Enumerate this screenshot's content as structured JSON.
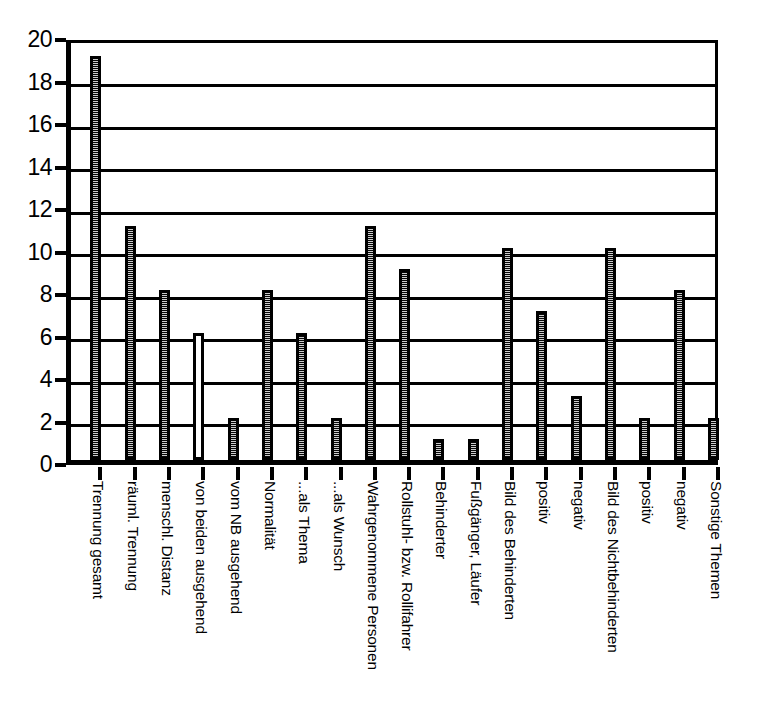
{
  "chart_data": {
    "type": "bar",
    "title": "",
    "subtitle": "",
    "xlabel": "",
    "ylabel": "",
    "ylim": [
      0,
      20
    ],
    "ytick_step": 2,
    "yticks": [
      20,
      18,
      16,
      14,
      12,
      10,
      8,
      6,
      4,
      2,
      0
    ],
    "grid": true,
    "gridlines_y": [
      20,
      18,
      16,
      14,
      12,
      10,
      8,
      6,
      4,
      2
    ],
    "legend": null,
    "legend_position": "none",
    "orientation": "vertical",
    "bar_style_default": "filled-hatched",
    "categories": [
      "Trennung gesamt",
      "räuml. Trennung",
      "menschl. Distanz",
      "von beiden ausgehend",
      "vom NB ausgehend",
      "Normalität",
      "...als Thema",
      "...als Wunsch",
      "Wahrgenommene Personen",
      "Rollstuhl- bzw. Rollifahrer",
      "Behinderter",
      "Fußgänger, Läufer",
      "Bild des Behinderten",
      "positiv",
      "negativ",
      "Bild des Nichtbehinderten",
      "positiv",
      "negativ",
      "Sonstige Themen"
    ],
    "values": [
      19,
      11,
      8,
      6,
      2,
      8,
      6,
      2,
      11,
      9,
      1,
      1,
      10,
      7,
      3,
      10,
      2,
      8,
      2
    ],
    "bar_styles": [
      "filled",
      "filled",
      "filled",
      "hollow",
      "filled",
      "filled",
      "filled",
      "filled",
      "filled",
      "filled",
      "filled",
      "filled",
      "filled",
      "filled",
      "filled",
      "filled",
      "filled",
      "filled",
      "filled"
    ],
    "colors": {
      "axis": "#000000",
      "grid": "#000000",
      "bar_outline": "#000000",
      "bar_fill": "#8d8d8d",
      "background": "#ffffff"
    }
  }
}
